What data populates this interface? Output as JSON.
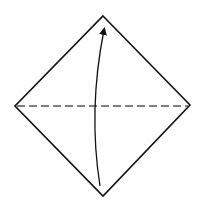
{
  "diagram": {
    "type": "origami-fold-step",
    "colors": {
      "background": "#ffffff",
      "outline": "#111111",
      "fold_line": "#555555",
      "arrow": "#111111"
    },
    "shapes": {
      "diamond": {
        "top": [
          103,
          16
        ],
        "right": [
          190,
          105
        ],
        "bottom": [
          103,
          196
        ],
        "left": [
          15,
          106
        ]
      },
      "fold_line": {
        "from": [
          17,
          106
        ],
        "to": [
          188,
          106
        ],
        "style": "dashed"
      },
      "arrow": {
        "from": [
          100,
          186
        ],
        "to": [
          105,
          26
        ],
        "curve": "bow-left"
      }
    }
  }
}
